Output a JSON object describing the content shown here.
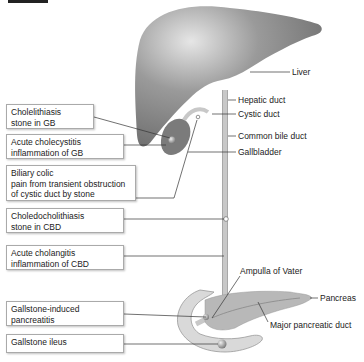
{
  "figure": {
    "title_tag": "",
    "left_labels": [
      {
        "line1": "Cholelithiasis",
        "line2": "stone in GB"
      },
      {
        "line1": "Acute cholecystitis",
        "line2": "inflammation of GB"
      },
      {
        "line1": "Biliary colic",
        "line2": "pain from transient obstruction",
        "line3": "of cystic duct by stone"
      },
      {
        "line1": "Choledocholithiasis",
        "line2": "stone in CBD"
      },
      {
        "line1": "Acute cholangitis",
        "line2": "inflammation of CBD"
      },
      {
        "line1": "Gallstone-induced",
        "line2": "pancreatitis"
      },
      {
        "line1": "Gallstone ileus"
      }
    ],
    "right_labels": {
      "liver": "Liver",
      "hepatic_duct": "Hepatic duct",
      "cystic_duct": "Cystic duct",
      "common_bile_duct": "Common bile duct",
      "gallbladder": "Gallbladder",
      "ampulla": "Ampulla of Vater",
      "pancreas": "Pancreas",
      "major_pancreatic_duct": "Major pancreatic duct"
    },
    "colors": {
      "liver": "#8a8a8a",
      "gallbladder": "#777777",
      "duct": "#c8c8c8",
      "pancreas": "#b8b8b8",
      "duodenum": "#d9d9d9",
      "leader": "#333333"
    }
  }
}
